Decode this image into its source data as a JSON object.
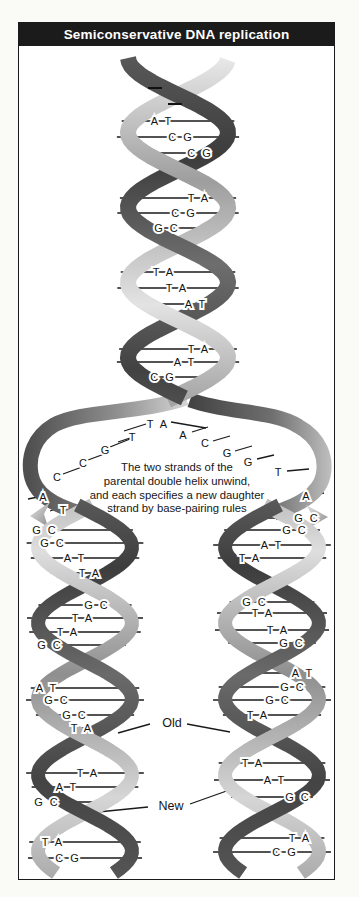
{
  "title": "Semiconservative DNA replication",
  "caption": {
    "lines": [
      "The two strands of the",
      "parental double helix unwind,",
      "and each specifies a new daughter",
      "strand by base-pairing rules"
    ]
  },
  "annotations": {
    "old": "Old",
    "new": "New"
  },
  "parental_helix": {
    "pairs": [
      "A T",
      "C G",
      "C G",
      "T A",
      "C G",
      "G C",
      "T A",
      "T A",
      "A T",
      "T A",
      "A T",
      "C G"
    ]
  },
  "fork": {
    "top_pair": "T A",
    "left_unpaired_bases": [
      "T",
      "G",
      "C",
      "C",
      "A",
      "T"
    ],
    "right_unpaired_bases": [
      "A",
      "C",
      "G",
      "G",
      "T",
      "A"
    ]
  },
  "left_daughter_helix": {
    "pairs": [
      "G C",
      "G C",
      "A T",
      "T A",
      "G C",
      "T A",
      "T A",
      "G C",
      "A T",
      "G C",
      "G C",
      "T A",
      "T A",
      "A T",
      "G C",
      "T A",
      "C G"
    ]
  },
  "right_daughter_helix": {
    "pairs": [
      "G C",
      "G C",
      "A T",
      "T A",
      "G C",
      "T A",
      "T A",
      "G C",
      "A T",
      "G C",
      "G C",
      "T A",
      "T A",
      "A T",
      "G C",
      "T A",
      "C G"
    ]
  },
  "colors": {
    "title_bar_bg": "#1b1b1b",
    "title_text": "#ffffff",
    "frame_border": "#1a1a1a",
    "old_strand_dark": "#4a4a4a",
    "new_strand_light": "#cfcfcf",
    "rung_line": "#1a1a1a",
    "page_bg": "#fafaf7"
  }
}
